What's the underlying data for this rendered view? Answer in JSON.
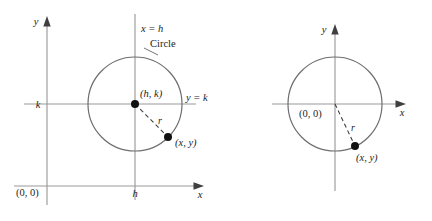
{
  "figure": {
    "type": "geometry-diagram",
    "background_color": "#ffffff",
    "axis_color": "#9a9a9a",
    "circle_color": "#6e6e72",
    "point_color": "#111111",
    "dash_color": "#3a3a3a"
  },
  "panels": [
    {
      "id": "left",
      "name": "circle-center-h-k",
      "axis_labels": {
        "y": "y",
        "x": "x"
      },
      "origin_label": "(0, 0)",
      "tick_labels": {
        "x_at_center": "h",
        "y_at_center": "k"
      },
      "guide_labels": {
        "vertical": "x = h",
        "horizontal": "y = k"
      },
      "shape_label": "Circle",
      "center_label": "(h, k)",
      "point_label": "(x, y)",
      "radius_label": "r",
      "geometry": {
        "circle_center": [
          135,
          104
        ],
        "circle_radius": 47,
        "point_on_circle": [
          168,
          137
        ]
      }
    },
    {
      "id": "right",
      "name": "circle-center-origin",
      "axis_labels": {
        "y": "y",
        "x": "x"
      },
      "origin_label": "(0, 0)",
      "point_label": "(x, y)",
      "radius_label": "r",
      "geometry": {
        "circle_center": [
          335,
          104
        ],
        "circle_radius": 47,
        "point_on_circle": [
          355,
          146
        ]
      }
    }
  ]
}
